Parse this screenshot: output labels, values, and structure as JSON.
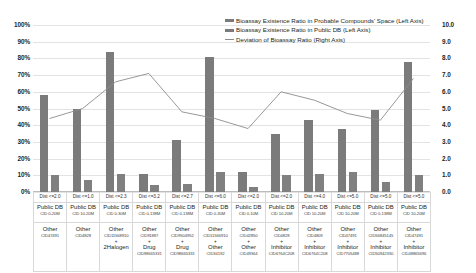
{
  "chart_data": {
    "type": "bar",
    "title": "",
    "xlabel": "",
    "ylabel": "",
    "ylim": [
      0,
      100
    ],
    "y2lim": [
      0,
      10
    ],
    "grid": true,
    "legend_position": "top-right",
    "y_left_ticks": [
      "100%",
      "90%",
      "80%",
      "70%",
      "60%",
      "50%",
      "40%",
      "30%",
      "20%",
      "10%",
      "0%"
    ],
    "y_right_ticks": [
      "10.0",
      "9.0",
      "8.0",
      "7.0",
      "6.0",
      "5.0",
      "4.0",
      "3.0",
      "2.0",
      "1.0",
      "0.0"
    ],
    "categories": [
      "Dist <=2.0",
      "Dist <=1.0",
      "Dist <=2.3",
      "Dist <=3.2",
      "Dist <=2.7",
      "Dist <=6.0",
      "Dist <=2.0",
      "Dist <=2.0",
      "Dist <=4.0",
      "Dist <=5.0",
      "Dist <=5.0",
      "Dist <=5.0"
    ],
    "series": [
      {
        "name": "Bioassay Existence Ratio in Probable Compounds' Space (Left Axis)",
        "axis": "left",
        "color": "#7b7b7b",
        "values": [
          58,
          50,
          84,
          11,
          31,
          81,
          12,
          35,
          43,
          38,
          49,
          78
        ]
      },
      {
        "name": "Bioassay Existence Ratio in Public DB (Left Axis)",
        "axis": "left",
        "color": "#808080",
        "values": [
          10,
          7,
          11,
          4,
          5,
          12,
          3,
          10,
          11,
          12,
          6,
          10
        ]
      },
      {
        "name": "Deviation of Bioassay Ratio (Right Axis)",
        "axis": "right",
        "color": "#8c8c8c",
        "type": "line",
        "values": [
          4.4,
          5.0,
          6.6,
          7.1,
          4.8,
          4.4,
          3.8,
          6.0,
          5.5,
          4.7,
          4.3,
          6.8
        ]
      }
    ],
    "x_axis_table": {
      "row_labels": [
        "Dist",
        "Public DB",
        "Other"
      ],
      "columns": [
        {
          "dist": "Dist <=2.0",
          "db_main": "Public DB",
          "db_sub": "CID 0-20M",
          "other_main": "Other",
          "other_sub": "CID47491",
          "plus": "",
          "mod_main": "",
          "mod_sub": ""
        },
        {
          "dist": "Dist <=1.0",
          "db_main": "Public DB",
          "db_sub": "CID 10-20M",
          "other_main": "Other",
          "other_sub": "CID4828",
          "plus": "",
          "mod_main": "",
          "mod_sub": ""
        },
        {
          "dist": "Dist <=2.3",
          "db_main": "Public DB",
          "db_sub": "CID 0-30M",
          "other_main": "Other",
          "other_sub": "CID11568910",
          "plus": "+",
          "mod_main": "2Halogen",
          "mod_sub": ""
        },
        {
          "dist": "Dist <=3.2",
          "db_main": "Public DB",
          "db_sub": "CID 0-138M",
          "other_main": "Other",
          "other_sub": "CID91887",
          "plus": "+",
          "mod_main": "Drug",
          "mod_sub": "CID98665331"
        },
        {
          "dist": "Dist <=2.7",
          "db_main": "Public DB",
          "db_sub": "CID 0-138M",
          "other_main": "Other",
          "other_sub": "CID9504952",
          "plus": "+",
          "mod_main": "Drug",
          "mod_sub": "CID98665331"
        },
        {
          "dist": "Dist <=6.0",
          "db_main": "Public DB",
          "db_sub": "CID 0-30M",
          "other_main": "Other",
          "other_sub": "CID11566910",
          "plus": "+",
          "mod_main": "Other",
          "mod_sub": "CID34192"
        },
        {
          "dist": "Dist <=2.0",
          "db_main": "Public DB",
          "db_sub": "CID 0-10M",
          "other_main": "Other",
          "other_sub": "CID42850",
          "plus": "+",
          "mod_main": "Other",
          "mod_sub": "CID49364"
        },
        {
          "dist": "Dist <=2.0",
          "db_main": "Public DB",
          "db_sub": "CID 10-20M",
          "other_main": "Other",
          "other_sub": "CID4828",
          "plus": "+",
          "mod_main": "Inhibitor",
          "mod_sub": "CID6764C208"
        },
        {
          "dist": "Dist <=4.0",
          "db_main": "Public DB",
          "db_sub": "CID 10-20M",
          "other_main": "Other",
          "other_sub": "CID4809",
          "plus": "+",
          "mod_main": "Inhibitor",
          "mod_sub": "CID6764C208"
        },
        {
          "dist": "Dist <=5.0",
          "db_main": "Public DB",
          "db_sub": "CID 10-20M",
          "other_main": "Other",
          "other_sub": "CID47491",
          "plus": "+",
          "mod_main": "Inhibitor",
          "mod_sub": "CID7705488"
        },
        {
          "dist": "Dist <=5.0",
          "db_main": "Public DB",
          "db_sub": "CID 0-138M",
          "other_main": "Other",
          "other_sub": "CID56845145",
          "plus": "+",
          "mod_main": "Inhibitor",
          "mod_sub": "CID50942330"
        },
        {
          "dist": "Dist <=5.0",
          "db_main": "Public DB",
          "db_sub": "CID 10-20M",
          "other_main": "Other",
          "other_sub": "CID47491",
          "plus": "+",
          "mod_main": "Inhibitor",
          "mod_sub": "CID48865696"
        }
      ]
    }
  }
}
